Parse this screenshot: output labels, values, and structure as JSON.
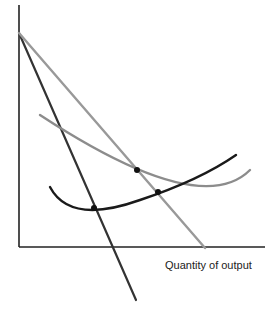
{
  "chart_data": {
    "type": "line",
    "title": "",
    "xlabel": "Quantity of output",
    "ylabel": "",
    "grid": false,
    "legend": null,
    "axes": {
      "origin": [
        19,
        247
      ],
      "y_top": 5,
      "x_right": 265
    },
    "series": [
      {
        "name": "steep-dark-line",
        "kind": "straight",
        "color": "#333333",
        "points": [
          [
            19,
            33
          ],
          [
            136,
            300
          ]
        ]
      },
      {
        "name": "grey-straight-line",
        "kind": "straight",
        "color": "#999999",
        "points": [
          [
            19,
            33
          ],
          [
            205,
            248
          ]
        ]
      },
      {
        "name": "grey-u-curve",
        "kind": "curve",
        "color": "#8c8c8c",
        "path": "M40,115 Q200,220 250,170"
      },
      {
        "name": "black-rising-curve",
        "kind": "curve",
        "color": "#1a1a1a",
        "path": "M50,187 Q70,225 140,200 Q200,180 236,155"
      }
    ],
    "points": [
      {
        "name": "intersection-dot-1",
        "x": 137,
        "y": 170
      },
      {
        "name": "intersection-dot-2",
        "x": 158,
        "y": 192
      },
      {
        "name": "intersection-dot-3",
        "x": 94,
        "y": 208
      }
    ]
  }
}
